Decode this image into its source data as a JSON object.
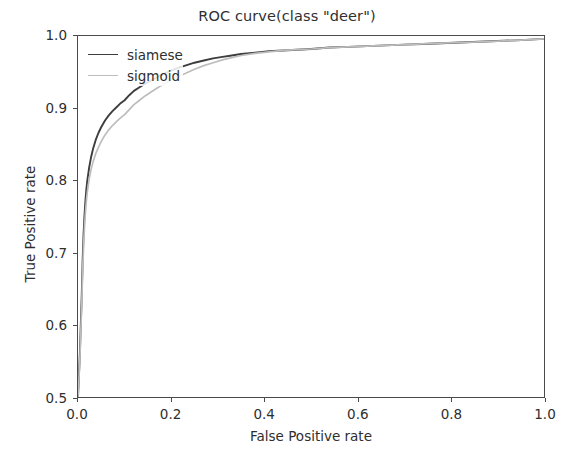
{
  "chart_data": {
    "type": "line",
    "title": "ROC curve(class \"deer\")",
    "xlabel": "False Positive rate",
    "ylabel": "True Positive rate",
    "xlim": [
      0.0,
      1.0
    ],
    "ylim": [
      0.5,
      1.0
    ],
    "xticks": [
      "0.0",
      "0.2",
      "0.4",
      "0.6",
      "0.8",
      "1.0"
    ],
    "xtick_values": [
      0.0,
      0.2,
      0.4,
      0.6,
      0.8,
      1.0
    ],
    "yticks": [
      "0.5",
      "0.6",
      "0.7",
      "0.8",
      "0.9",
      "1.0"
    ],
    "ytick_values": [
      0.5,
      0.6,
      0.7,
      0.8,
      0.9,
      1.0
    ],
    "grid": false,
    "legend_position": "upper left",
    "legend_frame": false,
    "background_color": "#ffffff",
    "axis_color": "#4a4a4a",
    "series": [
      {
        "name": "siamese",
        "color": "#3d3d3d",
        "linewidth": 1.9,
        "x": [
          0.0,
          0.004,
          0.008,
          0.01,
          0.012,
          0.014,
          0.016,
          0.018,
          0.02,
          0.024,
          0.028,
          0.032,
          0.038,
          0.044,
          0.05,
          0.058,
          0.066,
          0.074,
          0.082,
          0.09,
          0.1,
          0.11,
          0.12,
          0.132,
          0.144,
          0.156,
          0.17,
          0.185,
          0.2,
          0.215,
          0.23,
          0.25,
          0.27,
          0.29,
          0.31,
          0.33,
          0.35,
          0.38,
          0.41,
          0.44,
          0.47,
          0.5,
          0.54,
          0.58,
          0.62,
          0.66,
          0.7,
          0.74,
          0.78,
          0.82,
          0.86,
          0.9,
          0.94,
          0.97,
          1.0
        ],
        "y": [
          0.5,
          0.56,
          0.64,
          0.69,
          0.726,
          0.752,
          0.772,
          0.788,
          0.8,
          0.818,
          0.832,
          0.843,
          0.856,
          0.866,
          0.874,
          0.883,
          0.89,
          0.896,
          0.901,
          0.906,
          0.911,
          0.918,
          0.924,
          0.929,
          0.934,
          0.938,
          0.943,
          0.948,
          0.952,
          0.956,
          0.959,
          0.963,
          0.966,
          0.969,
          0.971,
          0.973,
          0.975,
          0.977,
          0.979,
          0.98,
          0.981,
          0.982,
          0.984,
          0.985,
          0.986,
          0.987,
          0.988,
          0.989,
          0.99,
          0.991,
          0.992,
          0.993,
          0.994,
          0.995,
          0.996
        ]
      },
      {
        "name": "sigmoid",
        "color": "#bdbdbd",
        "linewidth": 1.7,
        "x": [
          0.0,
          0.004,
          0.008,
          0.01,
          0.012,
          0.014,
          0.016,
          0.018,
          0.02,
          0.024,
          0.028,
          0.032,
          0.038,
          0.044,
          0.05,
          0.058,
          0.066,
          0.074,
          0.082,
          0.09,
          0.1,
          0.11,
          0.12,
          0.132,
          0.144,
          0.156,
          0.17,
          0.185,
          0.2,
          0.215,
          0.23,
          0.25,
          0.27,
          0.29,
          0.31,
          0.33,
          0.35,
          0.38,
          0.41,
          0.44,
          0.47,
          0.5,
          0.54,
          0.58,
          0.62,
          0.66,
          0.7,
          0.74,
          0.78,
          0.82,
          0.86,
          0.9,
          0.94,
          0.97,
          1.0
        ],
        "y": [
          0.5,
          0.552,
          0.628,
          0.676,
          0.71,
          0.736,
          0.756,
          0.772,
          0.784,
          0.802,
          0.815,
          0.825,
          0.837,
          0.846,
          0.854,
          0.863,
          0.87,
          0.876,
          0.881,
          0.886,
          0.891,
          0.898,
          0.905,
          0.911,
          0.917,
          0.922,
          0.928,
          0.934,
          0.939,
          0.944,
          0.948,
          0.954,
          0.959,
          0.963,
          0.967,
          0.97,
          0.973,
          0.976,
          0.978,
          0.98,
          0.981,
          0.982,
          0.984,
          0.985,
          0.986,
          0.987,
          0.988,
          0.989,
          0.99,
          0.991,
          0.992,
          0.993,
          0.994,
          0.995,
          0.996
        ]
      }
    ]
  },
  "legend": {
    "items": [
      {
        "label": "siamese"
      },
      {
        "label": "sigmoid"
      }
    ]
  }
}
